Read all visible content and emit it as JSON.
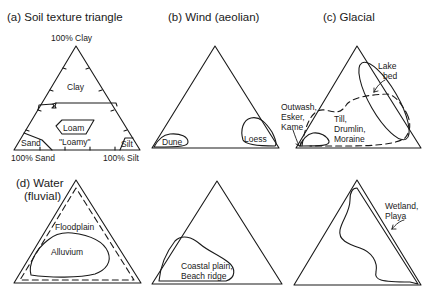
{
  "panels": {
    "a": {
      "title": "(a) Soil texture triangle",
      "apex_label": "100% Clay",
      "left_label": "100% Sand",
      "right_label": "100% Silt",
      "regions": [
        "Clay",
        "Loam",
        "\"Loamy\"",
        "Sand",
        "Silt"
      ]
    },
    "b": {
      "title": "(b) Wind (aeolian)",
      "regions": [
        "Dune",
        "Loess"
      ]
    },
    "c": {
      "title": "(c)  Glacial",
      "regions": [
        "Lake",
        "bed",
        "Outwash,",
        "Esker,",
        "Kame",
        "Till,",
        "Drumlin,",
        "Moraine"
      ]
    },
    "d": {
      "title_line1": "(d) Water",
      "title_line2": "(fluvial)",
      "regions": [
        "Floodplain",
        "Alluvium"
      ]
    },
    "e": {
      "regions": [
        "Coastal plain,",
        "Beach ridge"
      ]
    },
    "f": {
      "regions": [
        "Wetland,",
        "Playa"
      ]
    }
  },
  "colors": {
    "line": "#1a1a1a",
    "background": "#ffffff"
  }
}
